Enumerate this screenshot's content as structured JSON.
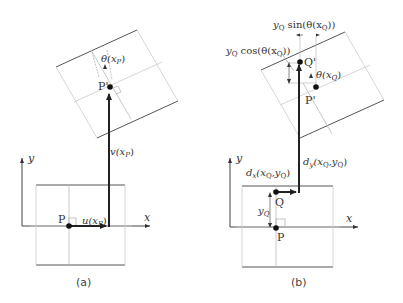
{
  "panels": {
    "a": {
      "caption": "(a)",
      "axis_x": "x",
      "axis_y": "y",
      "point_P": "P",
      "point_P_prime": "P'",
      "u_label": "u(x",
      "u_sub": "P",
      "u_close": ")",
      "v_label": "v(x",
      "v_sub": "P",
      "v_close": ")",
      "theta_label": "θ(x",
      "theta_sub": "P",
      "theta_close": ")"
    },
    "b": {
      "caption": "(b)",
      "axis_x": "x",
      "axis_y": "y",
      "point_P": "P",
      "point_Q": "Q",
      "point_P_prime": "P'",
      "point_Q_prime": "Q'",
      "yQ_label": "y",
      "yQ_sub": "Q",
      "dx_d": "d",
      "dx_sub": "x",
      "dx_args": "(x",
      "dx_argsub1": "Q",
      "dx_mid": ",y",
      "dx_argsub2": "Q",
      "dx_close": ")",
      "dy_d": "d",
      "dy_sub": "y",
      "dy_args": "(x",
      "dy_argsub1": "Q",
      "dy_mid": ",y",
      "dy_argsub2": "Q",
      "dy_close": ")",
      "sin_y": "y",
      "sin_ysub": "Q",
      "sin_text": " sin(θ(x",
      "sin_sub": "Q",
      "sin_close": "))",
      "cos_y": "y",
      "cos_ysub": "Q",
      "cos_text": " cos(θ(x",
      "cos_sub": "Q",
      "cos_close": "))",
      "theta_label": "θ(x",
      "theta_sub": "Q",
      "theta_close": ")"
    }
  },
  "colors": {
    "box_line": "#555555",
    "grid_line": "#c8c8c8",
    "arrow": "#222222",
    "axis": "#444444"
  }
}
